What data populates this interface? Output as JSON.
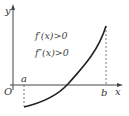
{
  "diagram": {
    "type": "function-graph",
    "axes": {
      "x_label": "x",
      "y_label": "y",
      "origin_label": "O"
    },
    "points": {
      "a_label": "a",
      "b_label": "b"
    },
    "conditions": [
      "f′(x)>0",
      "f″(x)>0"
    ],
    "curve": "increasing, concave up from below x-axis at x=a to high above at x=b",
    "colors": {
      "axis": "#444444",
      "curve": "#222222",
      "dashed": "#555555"
    }
  }
}
